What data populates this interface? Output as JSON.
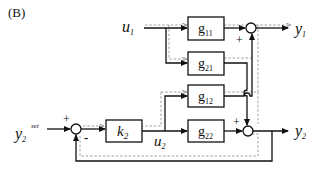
{
  "panel_label": "(B)",
  "inputs": {
    "u1": {
      "base": "u",
      "sub": "1"
    },
    "y2set": {
      "base": "y",
      "sub": "2",
      "sup": "set"
    }
  },
  "outputs": {
    "y1": {
      "base": "y",
      "sub": "1"
    },
    "y2": {
      "base": "y",
      "sub": "2"
    }
  },
  "signals": {
    "u2": {
      "base": "u",
      "sub": "2"
    }
  },
  "blocks": {
    "g11": {
      "base": "g",
      "sub": "11"
    },
    "g21": {
      "base": "g",
      "sub": "21"
    },
    "g12": {
      "base": "g",
      "sub": "12"
    },
    "g22": {
      "base": "g",
      "sub": "22"
    },
    "k2": {
      "base": "k",
      "sub": "2"
    }
  },
  "signs": {
    "sum0_plus": "+",
    "sum0_minus": "-",
    "sum1_plus": "+",
    "sum2_plus": "+"
  },
  "colors": {
    "line": "#111111",
    "dashed_path": "#8a8a8a"
  }
}
